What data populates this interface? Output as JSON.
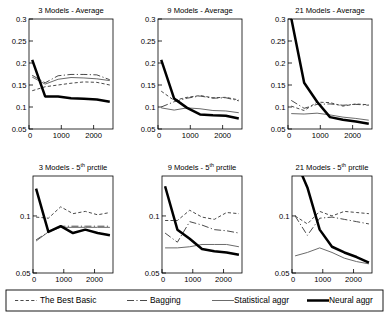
{
  "figure": {
    "legend": {
      "items": [
        {
          "label": "The Best Basic",
          "style": "dotted",
          "color": "#4a4a4a",
          "width": 1.0
        },
        {
          "label": "Bagging",
          "style": "dashdot",
          "color": "#4a4a4a",
          "width": 1.0
        },
        {
          "label": "Statistical aggr",
          "style": "solid",
          "color": "#6b6b6b",
          "width": 1.0
        },
        {
          "label": "Neural aggr",
          "style": "solid-thick",
          "color": "#000000",
          "width": 2.5
        }
      ]
    }
  },
  "chart_data": [
    {
      "type": "line",
      "title": "3 Models - Average",
      "title_main": "3 Models - Average",
      "xlabel": "",
      "ylabel": "",
      "xlim": [
        0,
        2600
      ],
      "ylim": [
        0.05,
        0.3
      ],
      "xticks": [
        0,
        1000,
        2000
      ],
      "xticklabels": [
        "0",
        "1000",
        "2000"
      ],
      "yticks": [
        0.05,
        0.1,
        0.15,
        0.2,
        0.25,
        0.3
      ],
      "yticklabels": [
        "0.05",
        "0.1",
        "0.15",
        "0.2",
        "0.25",
        "0.3"
      ],
      "grid": false,
      "x": [
        100,
        500,
        900,
        1300,
        1700,
        2100,
        2500
      ],
      "series": [
        {
          "name": "The Best Basic",
          "values": [
            0.137,
            0.146,
            0.15,
            0.154,
            0.157,
            0.156,
            0.15
          ]
        },
        {
          "name": "Bagging",
          "values": [
            0.172,
            0.155,
            0.171,
            0.174,
            0.174,
            0.173,
            0.162
          ]
        },
        {
          "name": "Statistical aggr",
          "values": [
            0.168,
            0.152,
            0.163,
            0.167,
            0.166,
            0.164,
            0.16
          ]
        },
        {
          "name": "Neural aggr",
          "values": [
            0.207,
            0.124,
            0.124,
            0.12,
            0.119,
            0.117,
            0.112
          ]
        }
      ]
    },
    {
      "type": "line",
      "title": "9 Models - Average",
      "title_main": "9 Models - Average",
      "xlabel": "",
      "ylabel": "",
      "xlim": [
        0,
        2600
      ],
      "ylim": [
        0.05,
        0.3
      ],
      "xticks": [
        0,
        1000,
        2000
      ],
      "xticklabels": [
        "0",
        "1000",
        "2000"
      ],
      "yticks": [
        0.05,
        0.1,
        0.15,
        0.2,
        0.25,
        0.3
      ],
      "yticklabels": [
        "0.05",
        "0.1",
        "0.15",
        "0.2",
        "0.25",
        "0.3"
      ],
      "grid": false,
      "x": [
        100,
        500,
        900,
        1300,
        1700,
        2100,
        2500
      ],
      "series": [
        {
          "name": "The Best Basic",
          "values": [
            0.136,
            0.115,
            0.122,
            0.126,
            0.121,
            0.122,
            0.116
          ]
        },
        {
          "name": "Bagging",
          "values": [
            0.1,
            0.112,
            0.12,
            0.125,
            0.12,
            0.121,
            0.114
          ]
        },
        {
          "name": "Statistical aggr",
          "values": [
            0.098,
            0.093,
            0.098,
            0.096,
            0.092,
            0.091,
            0.087
          ]
        },
        {
          "name": "Neural aggr",
          "values": [
            0.207,
            0.119,
            0.098,
            0.083,
            0.081,
            0.08,
            0.074
          ]
        }
      ]
    },
    {
      "type": "line",
      "title": "21 Models - Average",
      "title_main": "21 Models - Average",
      "xlabel": "",
      "ylabel": "",
      "xlim": [
        0,
        2600
      ],
      "ylim": [
        0.05,
        0.3
      ],
      "xticks": [
        0,
        1000,
        2000
      ],
      "xticklabels": [
        "0",
        "1000",
        "2000"
      ],
      "yticks": [
        0.05,
        0.1,
        0.15,
        0.2,
        0.25,
        0.3
      ],
      "yticklabels": [
        "0.05",
        "0.1",
        "0.15",
        "0.2",
        "0.25",
        "0.3"
      ],
      "grid": false,
      "x": [
        100,
        500,
        900,
        1300,
        1700,
        2100,
        2500
      ],
      "series": [
        {
          "name": "The Best Basic",
          "values": [
            0.102,
            0.092,
            0.111,
            0.11,
            0.102,
            0.107,
            0.105
          ]
        },
        {
          "name": "Bagging",
          "values": [
            0.115,
            0.097,
            0.106,
            0.107,
            0.104,
            0.106,
            0.104
          ]
        },
        {
          "name": "Statistical aggr",
          "values": [
            0.085,
            0.084,
            0.086,
            0.082,
            0.077,
            0.074,
            0.07
          ]
        },
        {
          "name": "Neural aggr",
          "values": [
            0.302,
            0.155,
            0.112,
            0.077,
            0.071,
            0.067,
            0.062
          ]
        }
      ]
    },
    {
      "type": "line",
      "title": "3 Models - 5th prctile",
      "title_main": "3 Models - 5",
      "title_sup": "th",
      "title_tail": " prctile",
      "xlabel": "",
      "ylabel": "",
      "xlim": [
        0,
        2600
      ],
      "ylim": [
        0.05,
        0.135
      ],
      "xticks": [
        0,
        1000,
        2000
      ],
      "xticklabels": [
        "0",
        "1000",
        "2000"
      ],
      "yticks": [
        0.05,
        0.1
      ],
      "yticklabels": [
        "0.05",
        "0.1"
      ],
      "grid": false,
      "x": [
        100,
        500,
        900,
        1300,
        1700,
        2100,
        2500
      ],
      "series": [
        {
          "name": "The Best Basic",
          "values": [
            0.099,
            0.098,
            0.108,
            0.102,
            0.104,
            0.101,
            0.103
          ]
        },
        {
          "name": "Bagging",
          "values": [
            0.079,
            0.086,
            0.091,
            0.091,
            0.091,
            0.091,
            0.091
          ]
        },
        {
          "name": "Statistical aggr",
          "values": [
            0.078,
            0.086,
            0.09,
            0.09,
            0.09,
            0.09,
            0.09
          ]
        },
        {
          "name": "Neural aggr",
          "values": [
            0.124,
            0.086,
            0.091,
            0.085,
            0.088,
            0.085,
            0.083
          ]
        }
      ]
    },
    {
      "type": "line",
      "title": "9 Models - 5th prctile",
      "title_main": "9 Models - 5",
      "title_sup": "th",
      "title_tail": " prctile",
      "xlabel": "",
      "ylabel": "",
      "xlim": [
        0,
        2600
      ],
      "ylim": [
        0.05,
        0.135
      ],
      "xticks": [
        0,
        1000,
        2000
      ],
      "xticklabels": [
        "0",
        "1000",
        "2000"
      ],
      "yticks": [
        0.05,
        0.1
      ],
      "yticklabels": [
        "0.05",
        "0.1"
      ],
      "grid": false,
      "x": [
        100,
        500,
        900,
        1300,
        1700,
        2100,
        2500
      ],
      "series": [
        {
          "name": "The Best Basic",
          "values": [
            0.096,
            0.096,
            0.105,
            0.099,
            0.097,
            0.103,
            0.102
          ]
        },
        {
          "name": "Bagging",
          "values": [
            0.085,
            0.077,
            0.095,
            0.092,
            0.088,
            0.087,
            0.085
          ]
        },
        {
          "name": "Statistical aggr",
          "values": [
            0.072,
            0.072,
            0.073,
            0.075,
            0.075,
            0.075,
            0.073
          ]
        },
        {
          "name": "Neural aggr",
          "values": [
            0.126,
            0.088,
            0.08,
            0.071,
            0.069,
            0.068,
            0.066
          ]
        }
      ]
    },
    {
      "type": "line",
      "title": "21 Models - 5th prctile",
      "title_main": "21 Models - 5",
      "title_sup": "th",
      "title_tail": " prctile",
      "xlabel": "",
      "ylabel": "",
      "xlim": [
        0,
        2600
      ],
      "ylim": [
        0.05,
        0.135
      ],
      "xticks": [
        0,
        1000,
        2000
      ],
      "xticklabels": [
        "0",
        "1000",
        "2000"
      ],
      "yticks": [
        0.05,
        0.1
      ],
      "yticklabels": [
        "0.05",
        "0.1"
      ],
      "grid": false,
      "x": [
        100,
        500,
        900,
        1300,
        1700,
        2100,
        2500
      ],
      "series": [
        {
          "name": "The Best Basic",
          "values": [
            0.1,
            0.093,
            0.104,
            0.1,
            0.104,
            0.103,
            0.102
          ]
        },
        {
          "name": "Bagging",
          "values": [
            0.1,
            0.083,
            0.098,
            0.099,
            0.097,
            0.095,
            0.093
          ]
        },
        {
          "name": "Statistical aggr",
          "values": [
            0.065,
            0.068,
            0.072,
            0.068,
            0.063,
            0.06,
            0.058
          ]
        },
        {
          "name": "Neural aggr",
          "values": [
            0.15,
            0.125,
            0.088,
            0.073,
            0.068,
            0.064,
            0.059
          ]
        }
      ]
    }
  ]
}
